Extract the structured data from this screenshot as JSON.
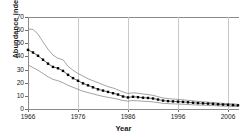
{
  "chart_data": {
    "type": "line",
    "title": "",
    "xlabel": "Year",
    "ylabel": "Abundance index",
    "xlim": [
      1966,
      2008
    ],
    "ylim": [
      0,
      70
    ],
    "yticks": [
      0,
      10,
      20,
      30,
      40,
      50,
      60,
      70
    ],
    "xticks": [
      1966,
      1976,
      1986,
      1996,
      2006
    ],
    "grid": "vertical gridlines at x ticks",
    "legend": "none",
    "x": [
      1966,
      1967,
      1968,
      1969,
      1970,
      1971,
      1972,
      1973,
      1974,
      1975,
      1976,
      1977,
      1978,
      1979,
      1980,
      1981,
      1982,
      1983,
      1984,
      1985,
      1986,
      1987,
      1988,
      1989,
      1990,
      1991,
      1992,
      1993,
      1994,
      1995,
      1996,
      1997,
      1998,
      1999,
      2000,
      2001,
      2002,
      2003,
      2004,
      2005,
      2006,
      2007,
      2008
    ],
    "series": [
      {
        "name": "Abundance index (estimate)",
        "style": "filled square markers with connecting line",
        "values": [
          45.0,
          43.0,
          40.5,
          37.5,
          34.5,
          32.0,
          31.0,
          29.0,
          26.0,
          23.5,
          21.5,
          19.5,
          18.0,
          16.5,
          15.0,
          14.0,
          13.0,
          12.0,
          11.0,
          9.5,
          8.8,
          9.3,
          9.0,
          8.6,
          8.4,
          8.0,
          7.2,
          6.4,
          6.0,
          5.8,
          5.6,
          5.4,
          5.1,
          4.8,
          4.5,
          4.3,
          4.1,
          3.9,
          3.6,
          3.4,
          3.2,
          3.0,
          2.8
        ]
      },
      {
        "name": "Upper confidence limit",
        "style": "thin grey line",
        "values": [
          61.0,
          60.5,
          57.0,
          51.0,
          45.5,
          41.0,
          38.5,
          37.5,
          32.5,
          29.5,
          27.0,
          25.0,
          23.0,
          21.5,
          20.0,
          18.5,
          17.0,
          16.0,
          14.5,
          13.0,
          11.8,
          12.3,
          12.0,
          11.4,
          11.0,
          10.4,
          9.4,
          8.4,
          7.9,
          7.6,
          7.3,
          7.0,
          6.6,
          6.2,
          5.8,
          5.5,
          5.2,
          5.0,
          4.6,
          4.3,
          4.1,
          3.9,
          3.6
        ]
      },
      {
        "name": "Lower confidence limit",
        "style": "thin grey line",
        "values": [
          33.5,
          31.5,
          29.5,
          27.0,
          24.5,
          22.5,
          21.5,
          20.0,
          18.0,
          16.5,
          15.0,
          13.5,
          12.5,
          11.5,
          10.5,
          9.6,
          8.9,
          8.2,
          7.4,
          6.5,
          6.0,
          6.4,
          6.2,
          5.9,
          5.7,
          5.4,
          4.9,
          4.3,
          4.1,
          3.9,
          3.8,
          3.6,
          3.4,
          3.2,
          3.0,
          2.9,
          2.7,
          2.6,
          2.4,
          2.2,
          2.1,
          2.0,
          1.9
        ]
      }
    ]
  },
  "axes": {
    "ylabel": "Abundance index",
    "xlabel": "Year",
    "ytick_labels": [
      "0",
      "10",
      "20",
      "30",
      "40",
      "50",
      "60",
      "70"
    ],
    "xtick_labels": [
      "1966",
      "1976",
      "1986",
      "1996",
      "2006"
    ]
  },
  "colors": {
    "marker": "#000000",
    "band": "#7d7d7d",
    "grid": "#c9c9c9",
    "frame": "#8a8a8a",
    "text": "#1a1a1a",
    "background": "#ffffff"
  }
}
